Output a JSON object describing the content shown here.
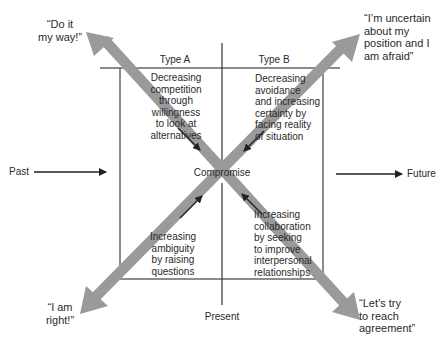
{
  "diagram": {
    "columns": [
      {
        "label": "Type A"
      },
      {
        "label": "Type B"
      }
    ],
    "quadrants": {
      "top_left": "Decreasing\ncompetition\nthrough\nwillingness\nto look at\nalternatives",
      "top_right": "Decreasing\navoidance\nand increasing\ncertainty by\nfacing reality\nof situation",
      "bottom_left": "Increasing\nambiguity\nby raising\nquestions",
      "bottom_right": "Increasing\ncollaboration\nby seeking\nto improve\ninterpersonal\nrelationships"
    },
    "center_label": "Compromise",
    "corners": {
      "top_left": "“Do it\nmy way!”",
      "top_right": "“I’m uncertain\nabout my\nposition and I\nam afraid”",
      "bottom_left": "“I am\nright!”",
      "bottom_right": "“Let’s try\nto reach\nagreement”"
    },
    "timeline": {
      "past": "Past",
      "present": "Present",
      "future": "Future"
    },
    "colors": {
      "diagonal_arrow": "#9a9a9a",
      "line": "#333333",
      "text": "#2a2a2a"
    }
  }
}
